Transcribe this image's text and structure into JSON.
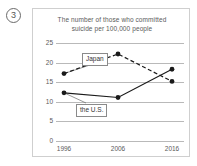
{
  "question": {
    "number": "3"
  },
  "chart_data": {
    "type": "line",
    "title": "The number of those who committed suicide per 100,000 people",
    "title_lines": [
      "The number of those who committed",
      "suicide per 100,000 people"
    ],
    "xlabel": "",
    "ylabel": "",
    "categories": [
      "1996",
      "2006",
      "2016"
    ],
    "x": [
      1996,
      2006,
      2016
    ],
    "ylim": [
      0,
      25
    ],
    "yticks": [
      "0",
      "5",
      "10",
      "15",
      "20",
      "25"
    ],
    "ytick_values": [
      0,
      5,
      10,
      15,
      20,
      25
    ],
    "grid": true,
    "legend": "inline-callouts",
    "series": [
      {
        "name": "Japan",
        "values": [
          17.2,
          22.2,
          15.2
        ],
        "style": "dashed",
        "color": "#1a1a1a",
        "marker": "circle"
      },
      {
        "name": "the U.S.",
        "values": [
          12.3,
          11.1,
          18.3
        ],
        "style": "solid",
        "color": "#1a1a1a",
        "marker": "circle"
      }
    ],
    "annotations": [
      {
        "text": "Japan",
        "points_to_series": "Japan",
        "points_to_index": 0
      },
      {
        "text": "the U.S.",
        "points_to_series": "the U.S.",
        "points_to_index": 0
      }
    ]
  },
  "colors": {
    "grid": "#b9b9b9",
    "frame": "#cfcfcf",
    "text": "#5a5a5a",
    "line": "#1a1a1a"
  }
}
